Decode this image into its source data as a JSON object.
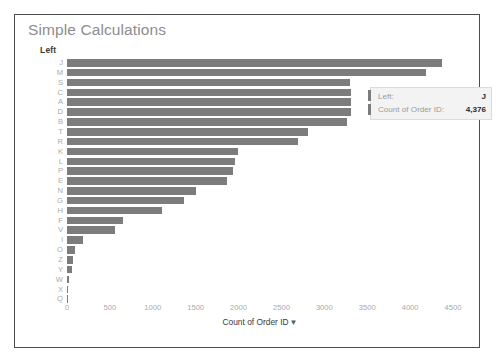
{
  "card": {
    "title": "Simple Calculations"
  },
  "axis_y": {
    "title": "Left"
  },
  "axis_x": {
    "title": "Count of Order ID",
    "sort_icon": "▼",
    "ticks": [
      "0",
      "500",
      "1000",
      "1500",
      "2000",
      "2500",
      "3000",
      "3500",
      "4000",
      "4500"
    ]
  },
  "tooltip": {
    "rows": [
      {
        "label": "Left:",
        "value": "J"
      },
      {
        "label": "Count of Order ID:",
        "value": "4,376"
      }
    ]
  },
  "colors": {
    "bar": "#7c7c7c",
    "card_border": "#4c4c4c",
    "title_text": "#8d8d8d",
    "tick_text": "#a9a9a9",
    "tooltip_bg": "#f3f3f3"
  },
  "chart_data": {
    "type": "bar",
    "orientation": "horizontal",
    "title": "Simple Calculations",
    "xlabel": "Count of Order ID",
    "ylabel": "Left",
    "xlim": [
      0,
      4500
    ],
    "grid": false,
    "legend": null,
    "categories": [
      "J",
      "M",
      "S",
      "C",
      "A",
      "D",
      "B",
      "T",
      "R",
      "K",
      "L",
      "P",
      "E",
      "N",
      "G",
      "H",
      "F",
      "V",
      "I",
      "O",
      "Z",
      "Y",
      "W",
      "X",
      "Q"
    ],
    "values": [
      4376,
      4190,
      3294,
      3312,
      3312,
      3312,
      3267,
      2814,
      2689,
      1998,
      1960,
      1934,
      1866,
      1507,
      1367,
      1110,
      657,
      555,
      185,
      91,
      72,
      53,
      26,
      11,
      0
    ],
    "highlighted_category": "J",
    "highlighted_value": "4,376"
  }
}
